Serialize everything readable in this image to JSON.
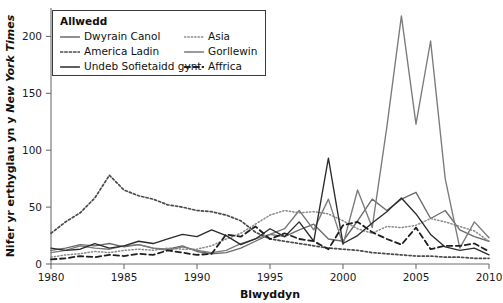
{
  "legend": {
    "title": "Allwedd",
    "entries": [
      {
        "label": "Dwyrain Canol",
        "color": "#6b6b6b",
        "style": "solid"
      },
      {
        "label": "Asia",
        "color": "#8a8a8a",
        "style": "fine-dotted"
      },
      {
        "label": "America Ladin",
        "color": "#4a4a4a",
        "style": "dotted"
      },
      {
        "label": "Gorllewin",
        "color": "#7a7a7a",
        "style": "solid"
      },
      {
        "label": "Undeb Sofietaidd gynt",
        "color": "#2b2b2b",
        "style": "solid"
      },
      {
        "label": "Affrica",
        "color": "#1f1f1f",
        "style": "dashed"
      }
    ]
  },
  "chart_data": {
    "type": "line",
    "title": "",
    "xlabel": "Blwyddyn",
    "ylabel": "Nifer yr erthyglau yn y New York Times",
    "ylabel_italic_part": "New York Times",
    "xlim": [
      1980,
      2010
    ],
    "ylim": [
      0,
      225
    ],
    "grid": false,
    "legend_position": "top-left",
    "xticks": [
      1980,
      1985,
      1990,
      1995,
      2000,
      2005,
      2010
    ],
    "yticks": [
      0,
      50,
      100,
      150,
      200
    ],
    "x": [
      1980,
      1981,
      1982,
      1983,
      1984,
      1985,
      1986,
      1987,
      1988,
      1989,
      1990,
      1991,
      1992,
      1993,
      1994,
      1995,
      1996,
      1997,
      1998,
      1999,
      2000,
      2001,
      2002,
      2003,
      2004,
      2005,
      2006,
      2007,
      2008,
      2009,
      2010
    ],
    "series": [
      {
        "name": "Dwyrain Canol",
        "color": "#6b6b6b",
        "style": "solid",
        "values": [
          12,
          14,
          17,
          16,
          18,
          15,
          17,
          14,
          13,
          16,
          11,
          9,
          10,
          14,
          20,
          26,
          24,
          30,
          35,
          22,
          20,
          38,
          57,
          47,
          57,
          63,
          40,
          47,
          30,
          24,
          20
        ]
      },
      {
        "name": "Asia",
        "color": "#8a8a8a",
        "style": "fine-dotted",
        "values": [
          6,
          8,
          9,
          11,
          10,
          12,
          13,
          12,
          14,
          13,
          13,
          16,
          22,
          27,
          35,
          43,
          47,
          45,
          46,
          44,
          38,
          31,
          27,
          33,
          32,
          34,
          40,
          37,
          33,
          29,
          20
        ]
      },
      {
        "name": "America Ladin",
        "color": "#4a4a4a",
        "style": "dotted",
        "values": [
          27,
          37,
          45,
          58,
          78,
          65,
          60,
          57,
          52,
          50,
          47,
          46,
          43,
          38,
          28,
          22,
          20,
          18,
          16,
          14,
          13,
          12,
          10,
          9,
          8,
          7,
          7,
          6,
          6,
          5,
          5
        ]
      },
      {
        "name": "Gorllewin",
        "color": "#7a7a7a",
        "style": "solid",
        "values": [
          10,
          12,
          16,
          14,
          13,
          16,
          17,
          14,
          12,
          15,
          12,
          10,
          12,
          18,
          22,
          26,
          31,
          47,
          30,
          57,
          17,
          65,
          32,
          120,
          218,
          123,
          196,
          75,
          14,
          37,
          23
        ]
      },
      {
        "name": "Undeb Sofietaidd gynt",
        "color": "#2b2b2b",
        "style": "solid",
        "values": [
          14,
          12,
          13,
          18,
          14,
          16,
          20,
          18,
          22,
          26,
          24,
          30,
          25,
          17,
          22,
          31,
          24,
          37,
          20,
          93,
          18,
          25,
          36,
          46,
          58,
          44,
          26,
          15,
          12,
          14,
          8
        ]
      },
      {
        "name": "Affrica",
        "color": "#1f1f1f",
        "style": "dashed",
        "values": [
          4,
          5,
          7,
          6,
          8,
          7,
          9,
          8,
          12,
          10,
          8,
          9,
          26,
          24,
          33,
          22,
          27,
          22,
          20,
          13,
          34,
          37,
          28,
          22,
          17,
          32,
          13,
          16,
          16,
          18,
          11
        ]
      }
    ]
  }
}
